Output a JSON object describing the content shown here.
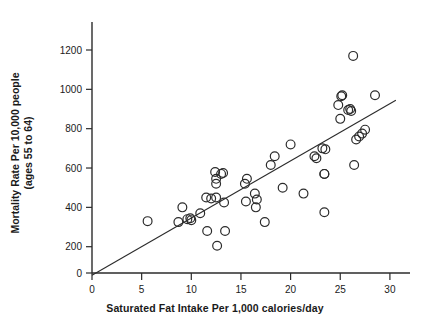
{
  "chart_data": {
    "type": "scatter",
    "title": "",
    "xlabel": "Saturated Fat Intake Per 1,000 calories/day",
    "ylabel_line1": "Mortality Rate Per 10,000 people",
    "ylabel_line2": "(ages 55 to 64)",
    "xlim": [
      0,
      31
    ],
    "ylim": [
      0,
      1300
    ],
    "xticks": [
      0,
      5,
      10,
      15,
      20,
      25,
      30
    ],
    "xtick_labels": [
      "0",
      "5",
      "10",
      "15",
      "20",
      "25",
      "30"
    ],
    "yticks": [
      0,
      200,
      400,
      600,
      800,
      1000,
      1200
    ],
    "ytick_labels": [
      "0",
      "200",
      "400",
      "600",
      "800",
      "1000",
      "1200"
    ],
    "grid": false,
    "legend": null,
    "marker": "open-circle",
    "series": [
      {
        "name": "countries",
        "points": [
          [
            5.6,
            330
          ],
          [
            8.7,
            325
          ],
          [
            9.1,
            400
          ],
          [
            9.6,
            340
          ],
          [
            9.9,
            345
          ],
          [
            10.0,
            335
          ],
          [
            10.9,
            370
          ],
          [
            11.5,
            450
          ],
          [
            11.6,
            280
          ],
          [
            12.0,
            445
          ],
          [
            12.4,
            580
          ],
          [
            12.5,
            545
          ],
          [
            12.5,
            520
          ],
          [
            12.5,
            450
          ],
          [
            12.6,
            205
          ],
          [
            13.0,
            570
          ],
          [
            13.2,
            575
          ],
          [
            13.3,
            425
          ],
          [
            13.4,
            280
          ],
          [
            15.4,
            520
          ],
          [
            15.5,
            430
          ],
          [
            15.6,
            545
          ],
          [
            16.4,
            470
          ],
          [
            16.5,
            400
          ],
          [
            16.6,
            440
          ],
          [
            17.4,
            325
          ],
          [
            18.0,
            615
          ],
          [
            18.4,
            660
          ],
          [
            19.2,
            500
          ],
          [
            20.0,
            720
          ],
          [
            21.3,
            470
          ],
          [
            22.4,
            660
          ],
          [
            22.6,
            650
          ],
          [
            23.2,
            700
          ],
          [
            23.4,
            570
          ],
          [
            23.4,
            570
          ],
          [
            23.4,
            375
          ],
          [
            23.5,
            695
          ],
          [
            24.8,
            920
          ],
          [
            25.0,
            850
          ],
          [
            25.1,
            965
          ],
          [
            25.2,
            970
          ],
          [
            25.8,
            895
          ],
          [
            26.0,
            900
          ],
          [
            26.1,
            890
          ],
          [
            26.3,
            1170
          ],
          [
            26.4,
            615
          ],
          [
            26.6,
            745
          ],
          [
            26.9,
            760
          ],
          [
            27.2,
            775
          ],
          [
            27.5,
            795
          ],
          [
            28.5,
            970
          ]
        ]
      }
    ],
    "fit_line": {
      "name": "least-squares trend line",
      "x0": 0.0,
      "y0": 55,
      "x1": 30.6,
      "y1": 945
    }
  }
}
